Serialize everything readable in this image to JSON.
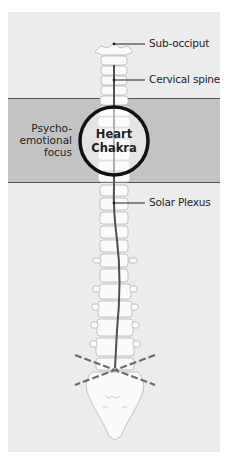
{
  "diagram": {
    "type": "anatomical-spine-diagram",
    "labels": {
      "sub_occiput": "Sub-occiput",
      "cervical_spine": "Cervical spine",
      "solar_plexus": "Solar Plexus"
    },
    "focus_band": {
      "line1": "Psycho-",
      "line2": "emotional",
      "line3": "focus"
    },
    "chakra": {
      "line1": "Heart",
      "line2": "Chakra"
    },
    "colors": {
      "background": "#ececec",
      "band": "#c3c3c3",
      "circle_stroke": "#111111",
      "spinal_line": "#555555",
      "bone": "#fafafa"
    }
  }
}
